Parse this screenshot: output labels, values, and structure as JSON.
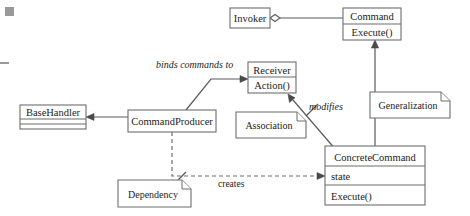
{
  "diagram": {
    "classes": [
      {
        "id": "base-handler",
        "name": "BaseHandler",
        "compartments": [
          "",
          ""
        ],
        "x": 20,
        "y": 105,
        "w": 66,
        "h": 24
      },
      {
        "id": "command-producer",
        "name": "CommandProducer",
        "compartments": [],
        "x": 128,
        "y": 110,
        "w": 88,
        "h": 22
      },
      {
        "id": "invoker",
        "name": "Invoker",
        "compartments": [],
        "x": 230,
        "y": 8,
        "w": 40,
        "h": 20
      },
      {
        "id": "command",
        "name": "Command",
        "compartments": [
          "Execute()"
        ],
        "x": 343,
        "y": 8,
        "w": 58,
        "h": 32
      },
      {
        "id": "receiver",
        "name": "Receiver",
        "compartments": [
          "Action()"
        ],
        "x": 248,
        "y": 62,
        "w": 48,
        "h": 31
      },
      {
        "id": "concrete-command",
        "name": "ConcreteCommand",
        "compartments": [
          "state",
          "Execute()"
        ],
        "x": 325,
        "y": 146,
        "w": 100,
        "h": 59
      }
    ],
    "notes": [
      {
        "id": "association-note",
        "label": "Association",
        "x": 236,
        "y": 112,
        "w": 70,
        "h": 26
      },
      {
        "id": "generalization-note",
        "label": "Generalization",
        "x": 370,
        "y": 92,
        "w": 80,
        "h": 26
      },
      {
        "id": "dependency-note",
        "label": "Dependency",
        "x": 118,
        "y": 180,
        "w": 73,
        "h": 27
      }
    ],
    "edge_labels": [
      {
        "id": "binds-commands-to-label",
        "text": "binds commands to",
        "style": "italic",
        "x": 156,
        "y": 68
      },
      {
        "id": "modifies-label",
        "text": "modifies",
        "style": "italic",
        "x": 309,
        "y": 110
      },
      {
        "id": "creates-label",
        "text": "creates",
        "style": "regular",
        "x": 218,
        "y": 187
      }
    ],
    "colors": {
      "stroke": "#6d6d6d",
      "line": "#5a5a5a",
      "text": "#1c1c1c",
      "background": "#ffffff"
    }
  }
}
